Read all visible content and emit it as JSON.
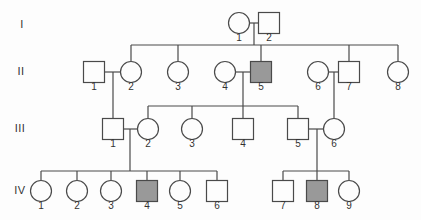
{
  "figure": {
    "type": "pedigree-chart",
    "width": 421,
    "height": 220,
    "colors": {
      "background": "#fdfdfd",
      "line": "#4a4a4a",
      "text": "#333333",
      "affected_fill": "#999999",
      "unaffected_fill": "#fdfdfd"
    }
  },
  "generation_labels": [
    {
      "text": "I",
      "x": 22,
      "y": 24
    },
    {
      "text": "II",
      "x": 21,
      "y": 71
    },
    {
      "text": "III",
      "x": 20,
      "y": 128
    },
    {
      "text": "IV",
      "x": 20,
      "y": 190
    }
  ],
  "individuals": [
    {
      "id": "I-1",
      "generation": "I",
      "label": "1",
      "sex": "female",
      "affected": false,
      "x": 239,
      "y": 23
    },
    {
      "id": "I-2",
      "generation": "I",
      "label": "2",
      "sex": "male",
      "affected": false,
      "x": 269,
      "y": 23
    },
    {
      "id": "II-1",
      "generation": "II",
      "label": "1",
      "sex": "male",
      "affected": false,
      "x": 94,
      "y": 72
    },
    {
      "id": "II-2",
      "generation": "II",
      "label": "2",
      "sex": "female",
      "affected": false,
      "x": 131,
      "y": 72
    },
    {
      "id": "II-3",
      "generation": "II",
      "label": "3",
      "sex": "female",
      "affected": false,
      "x": 178,
      "y": 72
    },
    {
      "id": "II-4",
      "generation": "II",
      "label": "4",
      "sex": "female",
      "affected": false,
      "x": 225,
      "y": 72
    },
    {
      "id": "II-5",
      "generation": "II",
      "label": "5",
      "sex": "male",
      "affected": true,
      "x": 261,
      "y": 72
    },
    {
      "id": "II-6",
      "generation": "II",
      "label": "6",
      "sex": "female",
      "affected": false,
      "x": 318,
      "y": 72
    },
    {
      "id": "II-7",
      "generation": "II",
      "label": "7",
      "sex": "male",
      "affected": false,
      "x": 349,
      "y": 72
    },
    {
      "id": "II-8",
      "generation": "II",
      "label": "8",
      "sex": "female",
      "affected": false,
      "x": 398,
      "y": 72
    },
    {
      "id": "III-1",
      "generation": "III",
      "label": "1",
      "sex": "male",
      "affected": false,
      "x": 113,
      "y": 129
    },
    {
      "id": "III-2",
      "generation": "III",
      "label": "2",
      "sex": "female",
      "affected": false,
      "x": 148,
      "y": 129
    },
    {
      "id": "III-3",
      "generation": "III",
      "label": "3",
      "sex": "female",
      "affected": false,
      "x": 192,
      "y": 129
    },
    {
      "id": "III-4",
      "generation": "III",
      "label": "4",
      "sex": "male",
      "affected": false,
      "x": 243,
      "y": 129
    },
    {
      "id": "III-5",
      "generation": "III",
      "label": "5",
      "sex": "male",
      "affected": false,
      "x": 298,
      "y": 129
    },
    {
      "id": "III-6",
      "generation": "III",
      "label": "6",
      "sex": "female",
      "affected": false,
      "x": 334,
      "y": 129
    },
    {
      "id": "IV-1",
      "generation": "IV",
      "label": "1",
      "sex": "female",
      "affected": false,
      "x": 41,
      "y": 191
    },
    {
      "id": "IV-2",
      "generation": "IV",
      "label": "2",
      "sex": "female",
      "affected": false,
      "x": 77,
      "y": 191
    },
    {
      "id": "IV-3",
      "generation": "IV",
      "label": "3",
      "sex": "female",
      "affected": false,
      "x": 111,
      "y": 191
    },
    {
      "id": "IV-4",
      "generation": "IV",
      "label": "4",
      "sex": "male",
      "affected": true,
      "x": 147,
      "y": 191
    },
    {
      "id": "IV-5",
      "generation": "IV",
      "label": "5",
      "sex": "female",
      "affected": false,
      "x": 180,
      "y": 191
    },
    {
      "id": "IV-6",
      "generation": "IV",
      "label": "6",
      "sex": "male",
      "affected": false,
      "x": 217,
      "y": 191
    },
    {
      "id": "IV-7",
      "generation": "IV",
      "label": "7",
      "sex": "male",
      "affected": false,
      "x": 283,
      "y": 191
    },
    {
      "id": "IV-8",
      "generation": "IV",
      "label": "8",
      "sex": "male",
      "affected": true,
      "x": 317,
      "y": 191
    },
    {
      "id": "IV-9",
      "generation": "IV",
      "label": "9",
      "sex": "female",
      "affected": false,
      "x": 349,
      "y": 191
    }
  ],
  "families": [
    {
      "parents": [
        "I-1",
        "I-2"
      ],
      "drop_x": 254,
      "bar_y": 45,
      "children": [
        "II-2",
        "II-3",
        "II-5",
        "II-7",
        "II-8"
      ]
    },
    {
      "parents": [
        "II-1",
        "II-2"
      ],
      "drop_x": 113,
      "bar_y": null,
      "children": [
        "III-1"
      ]
    },
    {
      "parents": [
        "II-4",
        "II-5"
      ],
      "drop_x": 243,
      "bar_y": 106,
      "children": [
        "III-2",
        "III-3",
        "III-4",
        "III-5"
      ]
    },
    {
      "parents": [
        "II-6",
        "II-7"
      ],
      "drop_x": 334,
      "bar_y": null,
      "children": [
        "III-6"
      ]
    },
    {
      "parents": [
        "III-1",
        "III-2"
      ],
      "drop_x": 130,
      "bar_y": 171,
      "children": [
        "IV-1",
        "IV-2",
        "IV-3",
        "IV-4",
        "IV-5",
        "IV-6"
      ]
    },
    {
      "parents": [
        "III-5",
        "III-6"
      ],
      "drop_x": 317,
      "bar_y": 171,
      "children": [
        "IV-7",
        "IV-8",
        "IV-9"
      ]
    }
  ]
}
